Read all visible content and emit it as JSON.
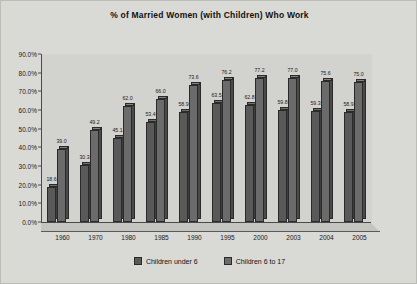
{
  "chart_data": {
    "type": "bar",
    "title": "% of Married Women (with Children) Who Work",
    "xlabel": "",
    "ylabel": "",
    "ylim": [
      0,
      90
    ],
    "ytick_labels": [
      "0.0%",
      "10.0%",
      "20.0%",
      "30.0%",
      "40.0%",
      "50.0%",
      "60.0%",
      "70.0%",
      "80.0%",
      "90.0%"
    ],
    "ytick_values": [
      0,
      10,
      20,
      30,
      40,
      50,
      60,
      70,
      80,
      90
    ],
    "grid": false,
    "legend_position": "bottom",
    "categories": [
      "1960",
      "1970",
      "1980",
      "1985",
      "1990",
      "1995",
      "2000",
      "2003",
      "2004",
      "2005"
    ],
    "series": [
      {
        "name": "Children under 6",
        "color": "#595959",
        "values": [
          18.6,
          30.3,
          45.1,
          53.4,
          58.9,
          63.5,
          62.8,
          59.8,
          59.3,
          58.9
        ],
        "labels": [
          "18.6",
          "30.3",
          "45.1",
          "53.4",
          "58.9",
          "63.5",
          "62.8",
          "59.8",
          "59.3",
          "58.9"
        ]
      },
      {
        "name": "Children 6 to 17",
        "color": "#6b6b6b",
        "values": [
          39.0,
          49.2,
          62.0,
          66.0,
          73.6,
          76.2,
          77.2,
          77.0,
          75.6,
          75.0
        ],
        "labels": [
          "39.0",
          "49.2",
          "62.0",
          "66.0",
          "73.6",
          "76.2",
          "77.2",
          "77.0",
          "75.6",
          "75.0"
        ]
      }
    ]
  },
  "legend": {
    "items": [
      {
        "label": "Children under 6",
        "color": "#595959"
      },
      {
        "label": "Children 6 to 17",
        "color": "#6b6b6b"
      }
    ]
  }
}
